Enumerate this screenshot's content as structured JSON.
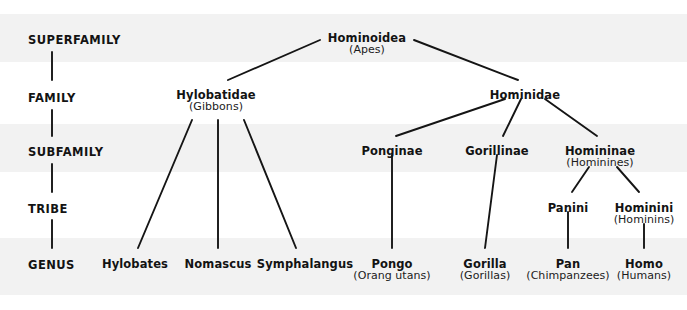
{
  "diagram": {
    "title_text": "",
    "line_color": "#151515",
    "text_color": "#131313",
    "background": "#ffffff",
    "band_color": "#f2f2f2",
    "bands": [
      {
        "name": "superfamily-band",
        "y": 14,
        "height": 48
      },
      {
        "name": "subfamily-band",
        "y": 124,
        "height": 48
      },
      {
        "name": "genus-band",
        "y": 238,
        "height": 57
      }
    ],
    "ranks": [
      {
        "id": "superfamily",
        "label": "SUPERFAMILY",
        "x": 28,
        "y": 33
      },
      {
        "id": "family",
        "label": "FAMILY",
        "x": 28,
        "y": 91
      },
      {
        "id": "subfamily",
        "label": "SUBFAMILY",
        "x": 28,
        "y": 145
      },
      {
        "id": "tribe",
        "label": "TRIBE",
        "x": 28,
        "y": 202
      },
      {
        "id": "genus",
        "label": "GENUS",
        "x": 28,
        "y": 258
      }
    ],
    "rank_connectors": [
      {
        "x": 52,
        "y1": 52,
        "y2": 80
      },
      {
        "x": 52,
        "y1": 110,
        "y2": 136
      },
      {
        "x": 52,
        "y1": 164,
        "y2": 192
      },
      {
        "x": 52,
        "y1": 220,
        "y2": 248
      }
    ],
    "nodes": [
      {
        "id": "hominoidea",
        "name": "Hominoidea",
        "common": "(Apes)",
        "x": 367,
        "y": 32
      },
      {
        "id": "hylobatidae",
        "name": "Hylobatidae",
        "common": "(Gibbons)",
        "x": 216,
        "y": 89
      },
      {
        "id": "hominidae",
        "name": "Hominidae",
        "common": "",
        "x": 525,
        "y": 89
      },
      {
        "id": "ponginae",
        "name": "Ponginae",
        "common": "",
        "x": 392,
        "y": 145
      },
      {
        "id": "gorillinae",
        "name": "Gorillinae",
        "common": "",
        "x": 497,
        "y": 145
      },
      {
        "id": "homininae",
        "name": "Homininae",
        "common": "(Hominines)",
        "x": 600,
        "y": 145
      },
      {
        "id": "panini",
        "name": "Panini",
        "common": "",
        "x": 568,
        "y": 202
      },
      {
        "id": "hominini",
        "name": "Hominini",
        "common": "(Hominins)",
        "x": 644,
        "y": 202
      },
      {
        "id": "hylobates",
        "name": "Hylobates",
        "common": "",
        "x": 135,
        "y": 258
      },
      {
        "id": "nomascus",
        "name": "Nomascus",
        "common": "",
        "x": 218,
        "y": 258
      },
      {
        "id": "symphalangus",
        "name": "Symphalangus",
        "common": "",
        "x": 305,
        "y": 258
      },
      {
        "id": "pongo",
        "name": "Pongo",
        "common": "(Orang utans)",
        "x": 392,
        "y": 258
      },
      {
        "id": "gorilla",
        "name": "Gorilla",
        "common": "(Gorillas)",
        "x": 485,
        "y": 258
      },
      {
        "id": "pan",
        "name": "Pan",
        "common": "(Chimpanzees)",
        "x": 568,
        "y": 258
      },
      {
        "id": "homo",
        "name": "Homo",
        "common": "(Humans)",
        "x": 644,
        "y": 258
      }
    ],
    "edges": [
      {
        "id": "hominoidea-hylobatidae",
        "x1": 320,
        "y1": 40,
        "x2": 228,
        "y2": 80
      },
      {
        "id": "hominoidea-hominidae",
        "x1": 414,
        "y1": 40,
        "x2": 518,
        "y2": 80
      },
      {
        "id": "hylobatidae-hylobates",
        "x1": 192,
        "y1": 120,
        "x2": 138,
        "y2": 248
      },
      {
        "id": "hylobatidae-nomascus",
        "x1": 218,
        "y1": 120,
        "x2": 218,
        "y2": 248
      },
      {
        "id": "hylobatidae-symphalangus",
        "x1": 244,
        "y1": 120,
        "x2": 296,
        "y2": 248
      },
      {
        "id": "hominidae-ponginae",
        "x1": 505,
        "y1": 99,
        "x2": 396,
        "y2": 136
      },
      {
        "id": "hominidae-gorillinae",
        "x1": 521,
        "y1": 99,
        "x2": 503,
        "y2": 136
      },
      {
        "id": "hominidae-homininae",
        "x1": 545,
        "y1": 99,
        "x2": 597,
        "y2": 136
      },
      {
        "id": "ponginae-pongo",
        "x1": 392,
        "y1": 155,
        "x2": 392,
        "y2": 248
      },
      {
        "id": "gorillinae-gorilla",
        "x1": 497,
        "y1": 155,
        "x2": 485,
        "y2": 248
      },
      {
        "id": "homininae-panini",
        "x1": 589,
        "y1": 167,
        "x2": 572,
        "y2": 192
      },
      {
        "id": "homininae-hominini",
        "x1": 617,
        "y1": 167,
        "x2": 639,
        "y2": 192
      },
      {
        "id": "panini-pan",
        "x1": 568,
        "y1": 212,
        "x2": 568,
        "y2": 248
      },
      {
        "id": "hominini-homo",
        "x1": 644,
        "y1": 224,
        "x2": 644,
        "y2": 248
      }
    ]
  }
}
